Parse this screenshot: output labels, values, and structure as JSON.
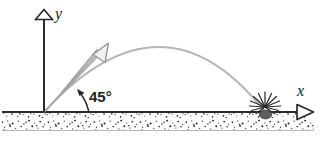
{
  "figure": {
    "kind": "projectile-motion-diagram",
    "width": 324,
    "height": 148,
    "background_color": "#ffffff"
  },
  "axes": {
    "y_axis": {
      "label": "y",
      "arrow_style": "hollow-chevron",
      "color": "#2b2b2b",
      "x": 44,
      "top": 18,
      "bottom": 112
    },
    "x_axis": {
      "label": "x",
      "arrow_style": "hollow-triangle",
      "color": "#2b2b2b",
      "y": 112,
      "left": 2,
      "right": 314
    }
  },
  "ground": {
    "name": "stippled-ground",
    "top": 113,
    "bottom": 130,
    "fill_color": "#fdfdfd",
    "stipple_color": "#2a2a2a"
  },
  "launch_vector": {
    "name": "initial-velocity-arrow",
    "color": "#a9a9a9",
    "outline_color": "#8a8a8a",
    "origin_x": 44,
    "origin_y": 112,
    "tip_x": 107,
    "tip_y": 47,
    "angle_degrees": 45
  },
  "angle_annotation": {
    "label": "45°",
    "label_x": 88,
    "label_y": 101,
    "arc_color": "#222222",
    "text_color": "#222222"
  },
  "trajectory": {
    "name": "parabolic-path",
    "color": "#b3b3b3",
    "start_x": 44,
    "start_y": 112,
    "apex_x": 163,
    "apex_y": 47,
    "end_x": 265,
    "end_y": 112
  },
  "impact": {
    "name": "impact-burst",
    "center_x": 265,
    "center_y": 113,
    "blob_color": "#5a5a5a",
    "ray_color": "#2a2a2a",
    "ray_count": 13
  }
}
